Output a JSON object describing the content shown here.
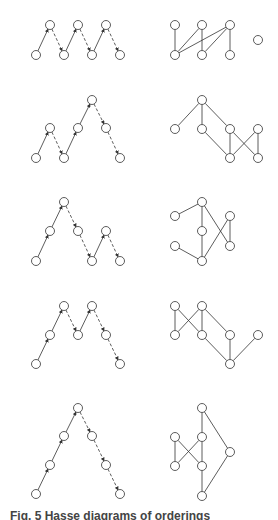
{
  "figure": {
    "caption": "Fig. 5  Hasse diagrams of orderings",
    "node_radius": 4.5,
    "stroke_color": "#333333",
    "node_fill": "#ffffff",
    "rows": [
      {
        "left": {
          "nodes": [
            [
              36,
              55
            ],
            [
              50,
              25
            ],
            [
              64,
              55
            ],
            [
              78,
              25
            ],
            [
              92,
              55
            ],
            [
              106,
              25
            ],
            [
              120,
              55
            ]
          ],
          "solid": [
            [
              0,
              1
            ],
            [
              2,
              3
            ],
            [
              4,
              5
            ]
          ],
          "dashed": [
            [
              1,
              2
            ],
            [
              3,
              4
            ],
            [
              5,
              6
            ]
          ]
        },
        "right": {
          "nodes": [
            [
              175,
              25
            ],
            [
              202,
              25
            ],
            [
              230,
              25
            ],
            [
              175,
              55
            ],
            [
              202,
              55
            ],
            [
              230,
              55
            ],
            [
              258,
              40
            ]
          ],
          "edges": [
            [
              0,
              3
            ],
            [
              1,
              3
            ],
            [
              1,
              4
            ],
            [
              2,
              3
            ],
            [
              2,
              4
            ],
            [
              2,
              5
            ]
          ]
        }
      },
      {
        "left": {
          "nodes": [
            [
              36,
              158
            ],
            [
              50,
              128
            ],
            [
              64,
              158
            ],
            [
              78,
              128
            ],
            [
              92,
              100
            ],
            [
              106,
              128
            ],
            [
              120,
              158
            ]
          ],
          "solid": [
            [
              0,
              1
            ],
            [
              2,
              3
            ],
            [
              3,
              4
            ]
          ],
          "dashed": [
            [
              1,
              2
            ],
            [
              4,
              5
            ],
            [
              5,
              6
            ]
          ]
        },
        "right": {
          "nodes": [
            [
              202,
              100
            ],
            [
              175,
              129
            ],
            [
              202,
              129
            ],
            [
              230,
              129
            ],
            [
              258,
              129
            ],
            [
              230,
              158
            ],
            [
              258,
              158
            ]
          ],
          "edges": [
            [
              0,
              1
            ],
            [
              0,
              2
            ],
            [
              0,
              3
            ],
            [
              2,
              5
            ],
            [
              3,
              5
            ],
            [
              3,
              6
            ],
            [
              4,
              5
            ],
            [
              4,
              6
            ]
          ]
        }
      },
      {
        "left": {
          "nodes": [
            [
              36,
              261
            ],
            [
              50,
              231
            ],
            [
              64,
              202
            ],
            [
              78,
              231
            ],
            [
              92,
              261
            ],
            [
              106,
              231
            ],
            [
              120,
              261
            ]
          ],
          "solid": [
            [
              0,
              1
            ],
            [
              1,
              2
            ],
            [
              4,
              5
            ]
          ],
          "dashed": [
            [
              2,
              3
            ],
            [
              3,
              4
            ],
            [
              5,
              6
            ]
          ]
        },
        "right": {
          "nodes": [
            [
              175,
              216
            ],
            [
              202,
              202
            ],
            [
              202,
              231
            ],
            [
              175,
              246
            ],
            [
              202,
              261
            ],
            [
              230,
              216
            ],
            [
              230,
              246
            ]
          ],
          "edges": [
            [
              0,
              1
            ],
            [
              1,
              2
            ],
            [
              2,
              4
            ],
            [
              3,
              4
            ],
            [
              1,
              6
            ],
            [
              4,
              5
            ],
            [
              5,
              6
            ]
          ]
        }
      },
      {
        "left": {
          "nodes": [
            [
              36,
              364
            ],
            [
              50,
              335
            ],
            [
              64,
              306
            ],
            [
              78,
              335
            ],
            [
              92,
              306
            ],
            [
              106,
              335
            ],
            [
              120,
              364
            ]
          ],
          "solid": [
            [
              0,
              1
            ],
            [
              1,
              2
            ],
            [
              3,
              4
            ]
          ],
          "dashed": [
            [
              2,
              3
            ],
            [
              4,
              5
            ],
            [
              5,
              6
            ]
          ]
        },
        "right": {
          "nodes": [
            [
              175,
              306
            ],
            [
              202,
              306
            ],
            [
              175,
              335
            ],
            [
              202,
              335
            ],
            [
              230,
              335
            ],
            [
              258,
              335
            ],
            [
              230,
              364
            ]
          ],
          "edges": [
            [
              0,
              2
            ],
            [
              0,
              3
            ],
            [
              1,
              2
            ],
            [
              1,
              3
            ],
            [
              1,
              4
            ],
            [
              3,
              6
            ],
            [
              4,
              6
            ],
            [
              5,
              6
            ]
          ]
        }
      },
      {
        "left": {
          "nodes": [
            [
              36,
              494
            ],
            [
              50,
              465
            ],
            [
              64,
              436
            ],
            [
              78,
              408
            ],
            [
              92,
              436
            ],
            [
              106,
              465
            ],
            [
              120,
              494
            ]
          ],
          "solid": [
            [
              0,
              1
            ],
            [
              1,
              2
            ],
            [
              2,
              3
            ]
          ],
          "dashed": [
            [
              3,
              4
            ],
            [
              4,
              5
            ],
            [
              5,
              6
            ]
          ]
        },
        "right": {
          "nodes": [
            [
              202,
              408
            ],
            [
              175,
              437
            ],
            [
              202,
              437
            ],
            [
              175,
              466
            ],
            [
              202,
              466
            ],
            [
              230,
              452
            ],
            [
              202,
              496
            ]
          ],
          "edges": [
            [
              0,
              2
            ],
            [
              0,
              5
            ],
            [
              1,
              3
            ],
            [
              1,
              4
            ],
            [
              2,
              3
            ],
            [
              2,
              4
            ],
            [
              4,
              6
            ],
            [
              5,
              6
            ]
          ]
        }
      }
    ]
  }
}
